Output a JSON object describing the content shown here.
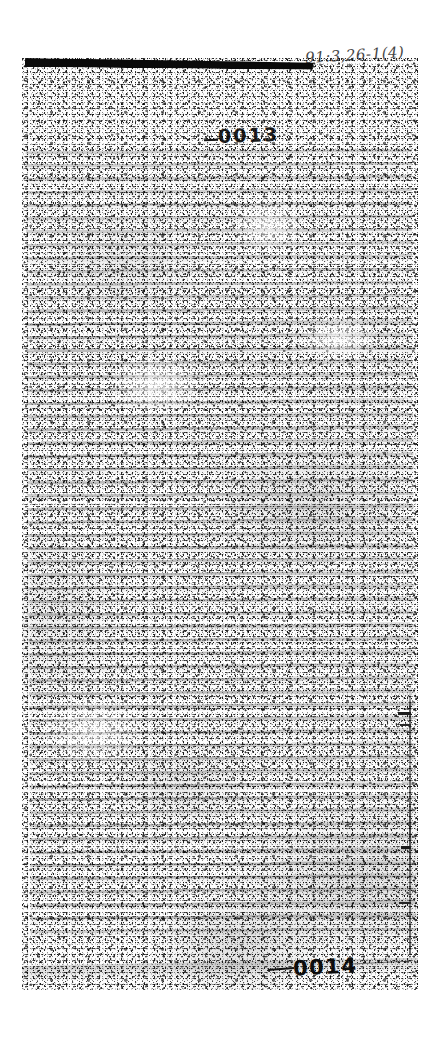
{
  "document": {
    "kind": "degraded photocopy scan of a typed page",
    "legibility_note": "body text is illegible",
    "redaction_bar_label": "redaction-bar"
  },
  "annotations": {
    "handwritten_reference": "91:3,26-1(4)"
  },
  "stamps": {
    "top_page_number": "0013",
    "bottom_page_number": "0014"
  }
}
